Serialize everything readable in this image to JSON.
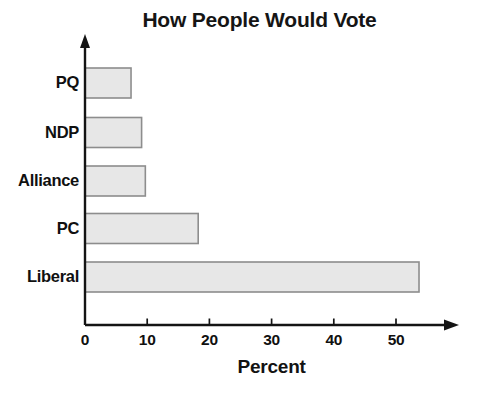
{
  "chart_data": {
    "type": "bar",
    "orientation": "horizontal",
    "title": "How People Would Vote",
    "xlabel": "Percent",
    "ylabel": "",
    "categories": [
      "Liberal",
      "PC",
      "Alliance",
      "NDP",
      "PQ"
    ],
    "values": [
      53.7,
      18.2,
      9.7,
      9.1,
      7.4
    ],
    "xlim": [
      0,
      60
    ],
    "xticks": [
      0,
      10,
      20,
      30,
      40,
      50
    ],
    "xtick_labels": [
      "0",
      "10",
      "20",
      "30",
      "40",
      "50"
    ],
    "grid": false,
    "legend": false,
    "bar_fill_color": "#e7e7e7",
    "bar_border_color": "#8d8d8d",
    "axis_color": "#141414",
    "background_color": "#ffffff"
  },
  "axes": {
    "x_axis_name": "percent-axis",
    "y_axis_name": "party-axis",
    "x_axis_has_arrow": true,
    "y_axis_has_arrow": true
  }
}
